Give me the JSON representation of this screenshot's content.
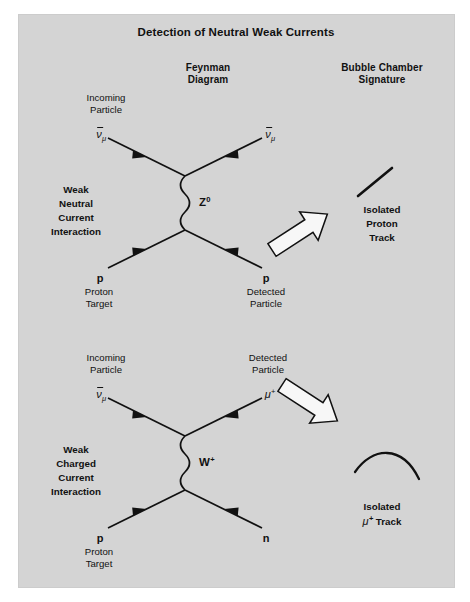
{
  "title": "Detection of Neutral Weak Currents",
  "headers": {
    "feynman": "Feynman",
    "feynman2": "Diagram",
    "bubble": "Bubble Chamber",
    "bubble2": "Signature"
  },
  "colors": {
    "panel_background": "#d4d4d4",
    "page_background": "#ffffff",
    "ink": "#111111",
    "arrow_fill": "#f7f7f7",
    "arrow_stroke": "#111111"
  },
  "neutral_current": {
    "incoming_label_1": "Incoming",
    "incoming_label_2": "Particle",
    "incoming_symbol_base": "ν",
    "incoming_symbol_sub": "μ",
    "outgoing_symbol_base": "ν",
    "outgoing_symbol_sub": "μ",
    "interaction_line_1": "Weak",
    "interaction_line_2": "Neutral",
    "interaction_line_3": "Current",
    "interaction_line_4": "Interaction",
    "boson_base": "Z",
    "boson_sup": "0",
    "target_symbol": "p",
    "target_label_1": "Proton",
    "target_label_2": "Target",
    "detected_symbol": "p",
    "detected_label_1": "Detected",
    "detected_label_2": "Particle",
    "signature_line_1": "Isolated",
    "signature_line_2": "Proton",
    "signature_line_3": "Track"
  },
  "charged_current": {
    "incoming_label_1": "Incoming",
    "incoming_label_2": "Particle",
    "incoming_symbol_base": "ν",
    "incoming_symbol_sub": "μ",
    "detected_label_1": "Detected",
    "detected_label_2": "Particle",
    "detected_symbol_base": "μ",
    "detected_symbol_sup": "+",
    "interaction_line_1": "Weak",
    "interaction_line_2": "Charged",
    "interaction_line_3": "Current",
    "interaction_line_4": "Interaction",
    "boson_base": "W",
    "boson_sup": "+",
    "target_symbol": "p",
    "target_label_1": "Proton",
    "target_label_2": "Target",
    "neutron_symbol": "n",
    "signature_line_1": "Isolated",
    "signature_symbol_base": "μ",
    "signature_symbol_sup": "+",
    "signature_line_2_suffix": " Track"
  }
}
